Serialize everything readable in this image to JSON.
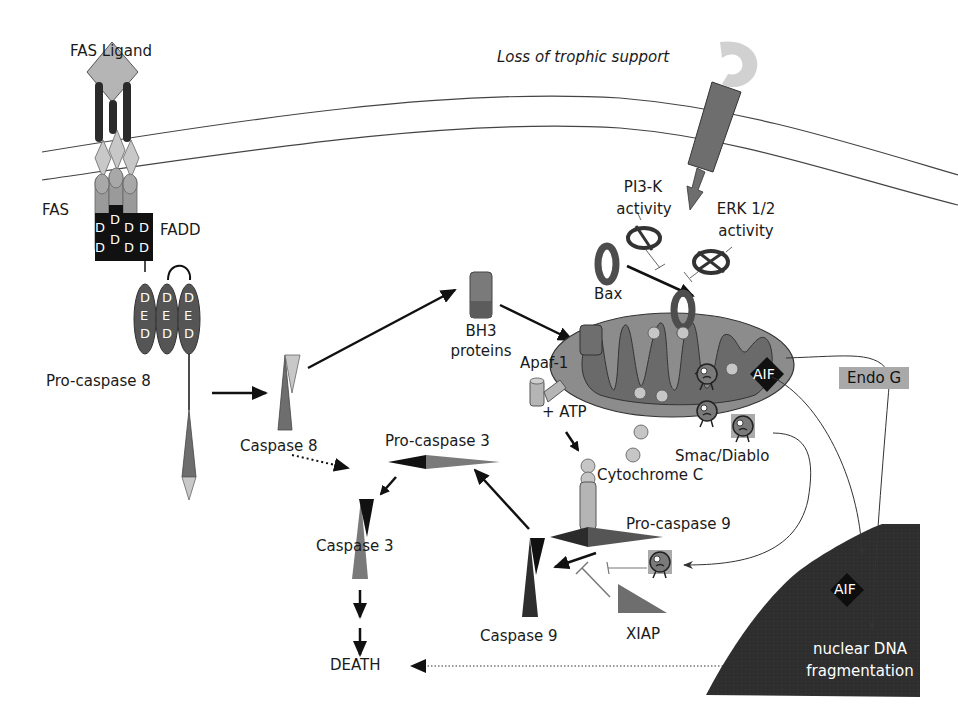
{
  "diagram": {
    "colors": {
      "background": "#ffffff",
      "dark": "#2b2b2b",
      "medium": "#7a7a7a",
      "light": "#b5b5b5",
      "black": "#111111",
      "nucleus": "#2e2e2e"
    },
    "labels": {
      "fas_ligand": "FAS Ligand",
      "fas": "FAS",
      "fadd": "FADD",
      "pro_caspase_8": "Pro-caspase 8",
      "caspase_8": "Caspase 8",
      "bh3_line1": "BH3",
      "bh3_line2": "proteins",
      "loss_trophic": "Loss of trophic support",
      "pi3k_line1": "PI3-K",
      "pi3k_line2": "activity",
      "erk_line1": "ERK 1/2",
      "erk_line2": "activity",
      "bax": "Bax",
      "apaf1": "Apaf-1",
      "atp": "+ ATP",
      "aif_mito": "AIF",
      "endo_g": "Endo G",
      "smac_diablo": "Smac/Diablo",
      "cytochrome_c": "Cytochrome C",
      "pro_caspase_3": "Pro-caspase 3",
      "caspase_3": "Caspase 3",
      "pro_caspase_9": "Pro-caspase 9",
      "caspase_9": "Caspase 9",
      "xiap": "XIAP",
      "death": "DEATH",
      "aif_nucleus": "AIF",
      "nuclear_line1": "nuclear DNA",
      "nuclear_line2": "fragmentation"
    },
    "domain_letters": {
      "death_domain": "D",
      "ded_d": "D",
      "ded_e": "E"
    }
  }
}
